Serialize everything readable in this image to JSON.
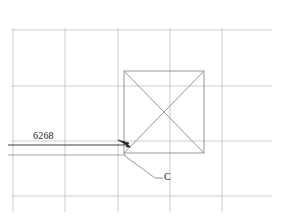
{
  "drawing": {
    "title": "engineering-detail-callout",
    "background_color": "#ffffff",
    "grid": {
      "color": "#c8c8c8",
      "stroke_width": 0.8,
      "vertical_x": [
        13,
        65,
        118,
        170,
        222
      ],
      "horizontal_y": [
        30,
        86,
        141,
        155,
        196
      ]
    },
    "shape": {
      "name": "square-with-diagonals",
      "color": "#8a8a8a",
      "stroke_width": 0.9,
      "x": 124,
      "y": 71,
      "width": 80,
      "height": 82,
      "diagonals": true
    },
    "dimension_line": {
      "label": "6268",
      "color": "#4a4a4a",
      "stroke_width": 1.0,
      "start_x": 8,
      "end_x": 130,
      "y": 145,
      "arrow": "arrow-head-right-down"
    },
    "extension_line": {
      "color": "#8a8a8a",
      "start_x": 8,
      "end_x": 124,
      "y": 155
    },
    "callout": {
      "label": "C",
      "color": "#8a8a8a",
      "vertex_x": 125,
      "vertex_y": 155,
      "elbow_x": 155,
      "elbow_y": 178,
      "end_x": 163,
      "end_y": 178
    }
  },
  "labels": {
    "dimension_value": "6268",
    "callout_letter": "C"
  }
}
